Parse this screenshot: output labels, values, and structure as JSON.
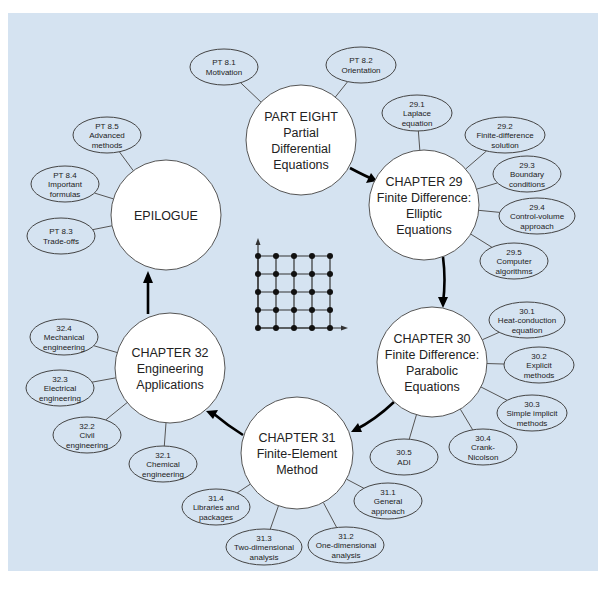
{
  "diagram": {
    "colors": {
      "panel": "#d5e3f1",
      "big_node": "#ffffff",
      "small_node": "#d5e3f1",
      "arrow": "#000000",
      "border": "#555555"
    },
    "main_nodes": [
      {
        "id": "part8",
        "lines": [
          "PART EIGHT",
          "Partial",
          "Differential",
          "Equations"
        ],
        "cx": 301,
        "cy": 140,
        "r": 55
      },
      {
        "id": "ch29",
        "lines": [
          "CHAPTER 29",
          "Finite Difference:",
          "Elliptic",
          "Equations"
        ],
        "cx": 424,
        "cy": 205,
        "r": 55
      },
      {
        "id": "ch30",
        "lines": [
          "CHAPTER 30",
          "Finite Difference:",
          "Parabolic",
          "Equations"
        ],
        "cx": 432,
        "cy": 362,
        "r": 55
      },
      {
        "id": "ch31",
        "lines": [
          "CHAPTER 31",
          "Finite-Element",
          "Method"
        ],
        "cx": 297,
        "cy": 453,
        "r": 56
      },
      {
        "id": "ch32",
        "lines": [
          "CHAPTER 32",
          "Engineering",
          "Applications"
        ],
        "cx": 170,
        "cy": 368,
        "r": 55
      },
      {
        "id": "epilogue",
        "lines": [
          "EPILOGUE"
        ],
        "cx": 166,
        "cy": 215,
        "r": 55
      }
    ],
    "sub_nodes": [
      {
        "parent": "part8",
        "lines": [
          "PT 8.1",
          "Motivation"
        ],
        "cx": 224,
        "cy": 67,
        "rx": 34,
        "ry": 18
      },
      {
        "parent": "part8",
        "lines": [
          "PT 8.2",
          "Orientation"
        ],
        "cx": 361,
        "cy": 65,
        "rx": 35,
        "ry": 18
      },
      {
        "parent": "ch29",
        "lines": [
          "29.1",
          "Laplace",
          "equation"
        ],
        "cx": 417,
        "cy": 113,
        "rx": 35,
        "ry": 18
      },
      {
        "parent": "ch29",
        "lines": [
          "29.2",
          "Finite-difference",
          "solution"
        ],
        "cx": 505,
        "cy": 135,
        "rx": 40,
        "ry": 18
      },
      {
        "parent": "ch29",
        "lines": [
          "29.3",
          "Boundary",
          "conditions"
        ],
        "cx": 527,
        "cy": 174,
        "rx": 34,
        "ry": 18
      },
      {
        "parent": "ch29",
        "lines": [
          "29.4",
          "Control-volume",
          "approach"
        ],
        "cx": 537,
        "cy": 216,
        "rx": 38,
        "ry": 18
      },
      {
        "parent": "ch29",
        "lines": [
          "29.5",
          "Computer",
          "algorithms"
        ],
        "cx": 514,
        "cy": 261,
        "rx": 34,
        "ry": 18
      },
      {
        "parent": "ch30",
        "lines": [
          "30.1",
          "Heat-conduction",
          "equation"
        ],
        "cx": 527,
        "cy": 320,
        "rx": 38,
        "ry": 18
      },
      {
        "parent": "ch30",
        "lines": [
          "30.2",
          "Explicit",
          "methods"
        ],
        "cx": 539,
        "cy": 365,
        "rx": 35,
        "ry": 18
      },
      {
        "parent": "ch30",
        "lines": [
          "30.3",
          "Simple implicit",
          "methods"
        ],
        "cx": 532,
        "cy": 413,
        "rx": 35,
        "ry": 18
      },
      {
        "parent": "ch30",
        "lines": [
          "30.4",
          "Crank-",
          "Nicolson"
        ],
        "cx": 483,
        "cy": 447,
        "rx": 34,
        "ry": 18
      },
      {
        "parent": "ch30",
        "lines": [
          "30.5",
          "ADI"
        ],
        "cx": 404,
        "cy": 457,
        "rx": 34,
        "ry": 18
      },
      {
        "parent": "ch31",
        "lines": [
          "31.1",
          "General",
          "approach"
        ],
        "cx": 388,
        "cy": 501,
        "rx": 34,
        "ry": 18
      },
      {
        "parent": "ch31",
        "lines": [
          "31.2",
          "One-dimensional",
          "analysis"
        ],
        "cx": 346,
        "cy": 545,
        "rx": 38,
        "ry": 18
      },
      {
        "parent": "ch31",
        "lines": [
          "31.3",
          "Two-dimensional",
          "analysis"
        ],
        "cx": 264,
        "cy": 547,
        "rx": 38,
        "ry": 18
      },
      {
        "parent": "ch31",
        "lines": [
          "31.4",
          "Libraries and",
          "packages"
        ],
        "cx": 216,
        "cy": 507,
        "rx": 34,
        "ry": 18
      },
      {
        "parent": "ch32",
        "lines": [
          "32.1",
          "Chemical",
          "engineering"
        ],
        "cx": 163,
        "cy": 464,
        "rx": 34,
        "ry": 18
      },
      {
        "parent": "ch32",
        "lines": [
          "32.2",
          "Civil",
          "engineering"
        ],
        "cx": 87,
        "cy": 435,
        "rx": 34,
        "ry": 18
      },
      {
        "parent": "ch32",
        "lines": [
          "32.3",
          "Electrical",
          "engineering"
        ],
        "cx": 60,
        "cy": 388,
        "rx": 34,
        "ry": 18
      },
      {
        "parent": "ch32",
        "lines": [
          "32.4",
          "Mechanical",
          "engineering"
        ],
        "cx": 64,
        "cy": 337,
        "rx": 34,
        "ry": 18
      },
      {
        "parent": "epilogue",
        "lines": [
          "PT 8.5",
          "Advanced",
          "methods"
        ],
        "cx": 107,
        "cy": 135,
        "rx": 34,
        "ry": 18
      },
      {
        "parent": "epilogue",
        "lines": [
          "PT 8.4",
          "Important",
          "formulas"
        ],
        "cx": 65,
        "cy": 184,
        "rx": 34,
        "ry": 18
      },
      {
        "parent": "epilogue",
        "lines": [
          "PT 8.3",
          "Trade-offs"
        ],
        "cx": 61,
        "cy": 236,
        "rx": 34,
        "ry": 18
      }
    ],
    "flow_arrows": [
      {
        "from": "part8",
        "to": "ch29",
        "path": "M 350 168 Q 365 176 377 181",
        "head": [
          377,
          181,
          366,
          183,
          371,
          173
        ]
      },
      {
        "from": "ch29",
        "to": "ch30",
        "path": "M 443 257 Q 446 280 443 303",
        "head": [
          443,
          308,
          438,
          297,
          448,
          297
        ]
      },
      {
        "from": "ch30",
        "to": "ch31",
        "path": "M 394 402 Q 375 420 355 430",
        "head": [
          351,
          432,
          358,
          423,
          362,
          432
        ]
      },
      {
        "from": "ch31",
        "to": "ch32",
        "path": "M 243 435 Q 227 425 214 414",
        "head": [
          206,
          411,
          218,
          410,
          213,
          419
        ]
      },
      {
        "from": "ch32",
        "to": "epilogue",
        "path": "M 148 314 L 148 280",
        "head": [
          148,
          271,
          143,
          283,
          153,
          283
        ]
      }
    ],
    "mesh_icon": {
      "name": "finite-difference-grid",
      "origin_x": 258,
      "origin_y": 328,
      "spacing": 18,
      "cols": 5,
      "rows": 5
    }
  }
}
